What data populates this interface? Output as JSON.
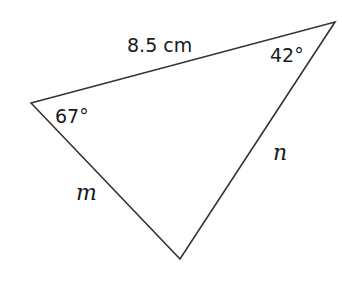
{
  "diagram": {
    "type": "triangle",
    "stroke_color": "#333333",
    "background": "#ffffff",
    "vertices": {
      "left": {
        "x": 31,
        "y": 103
      },
      "top_right": {
        "x": 335,
        "y": 22
      },
      "bottom": {
        "x": 180,
        "y": 259
      }
    },
    "labels": {
      "top_side_length": "8.5 cm",
      "top_right_angle": "42°",
      "left_angle": "67°",
      "right_side": "n",
      "left_side": "m"
    }
  }
}
